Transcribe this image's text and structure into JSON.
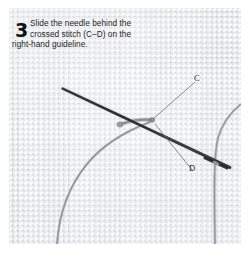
{
  "figure": {
    "kind": "embroidery-instruction-photo",
    "step_number": "3",
    "caption_lines": [
      "Slide the needle behind the",
      "crossed stitch (C–D) on the",
      "right-hand guideline."
    ],
    "caption_full": "Slide the needle behind the crossed stitch (C–D) on the right-hand guideline.",
    "labels": [
      {
        "id": "C",
        "text": "C"
      },
      {
        "id": "D",
        "text": "D"
      }
    ],
    "colors": {
      "page_background": "#ffffff",
      "fabric": "#fdfdfd",
      "weave_line": "#a8b0be",
      "thread": "#8d8f93",
      "needle": "#4a4c50",
      "text": "#1f1f21",
      "leader_line": "#6b6d71"
    }
  }
}
